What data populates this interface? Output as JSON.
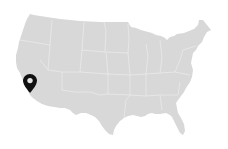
{
  "map": {
    "region": "Contiguous United States",
    "fill_color": "#d8d8d8",
    "border_color": "#ececec",
    "background": "#ffffff"
  },
  "marker": {
    "icon": "map-pin-icon",
    "color": "#111111",
    "location": "Southern California",
    "x": 30,
    "y": 92
  }
}
